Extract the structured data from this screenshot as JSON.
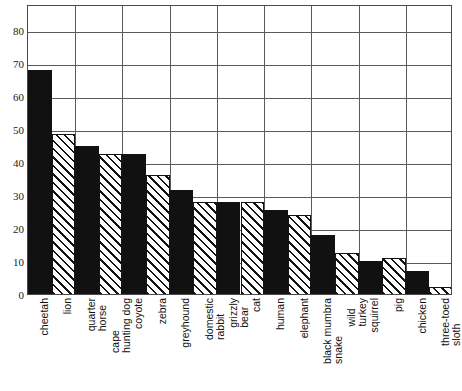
{
  "chart_data": {
    "type": "bar",
    "title": "",
    "subtitle": "",
    "xlabel": "",
    "ylabel": "",
    "ylim": [
      0,
      88
    ],
    "yticks": [
      0,
      10,
      20,
      30,
      40,
      50,
      60,
      70,
      80
    ],
    "grid": true,
    "legend": "none",
    "categories": [
      "cheetah",
      "lion",
      "quarter horse",
      "cape hunting dog",
      "coyote",
      "zebra",
      "greyhound",
      "domestic rabbit",
      "grizzly bear",
      "cat",
      "human",
      "elephant",
      "black mumbra snake",
      "wild turkey",
      "squirrel",
      "pig",
      "chicken",
      "three-toed sloth"
    ],
    "category_lines": [
      [
        "cheetah"
      ],
      [
        "lion"
      ],
      [
        "quarter",
        "horse"
      ],
      [
        "cape",
        "hunting dog"
      ],
      [
        "coyote"
      ],
      [
        "zebra"
      ],
      [
        "greyhound"
      ],
      [
        "domestic",
        "rabbit"
      ],
      [
        "grizzly",
        "bear"
      ],
      [
        "cat"
      ],
      [
        "human"
      ],
      [
        "elephant"
      ],
      [
        "black mumbra",
        "snake"
      ],
      [
        "wild",
        "turkey"
      ],
      [
        "squirrel"
      ],
      [
        "pig"
      ],
      [
        "chicken"
      ],
      [
        "three-toed",
        "sloth"
      ]
    ],
    "values": [
      68,
      48.5,
      45,
      42.5,
      42.5,
      36,
      31.5,
      28,
      28,
      28,
      25.5,
      24,
      18,
      12.5,
      10,
      11,
      7,
      2
    ],
    "fills": [
      "solid",
      "hatch",
      "solid",
      "hatch",
      "solid",
      "hatch",
      "solid",
      "hatch",
      "solid",
      "hatch",
      "solid",
      "hatch",
      "solid",
      "hatch",
      "solid",
      "hatch",
      "solid",
      "hatch"
    ],
    "colors": {
      "solid_bar": "#111111",
      "hatch_line": "#141414",
      "hatch_background": "#ffffff",
      "grid": "#5a5a5a",
      "axis": "#4a4a4a",
      "text": "#111111",
      "plot_background": "#ffffff"
    },
    "grid_vertical_count": 9
  }
}
